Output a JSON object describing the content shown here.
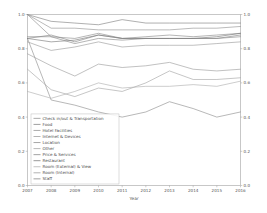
{
  "chart_data": {
    "type": "line",
    "title": "",
    "xlabel": "Year",
    "ylabel": "",
    "x": [
      2007,
      2008,
      2009,
      2010,
      2011,
      2012,
      2013,
      2014,
      2015,
      2016
    ],
    "xticklabels": [
      "2007",
      "2008",
      "2009",
      "2010",
      "2011",
      "2012",
      "2013",
      "2014",
      "2015",
      "2016"
    ],
    "yticklabels": [
      "0.0",
      "0.2",
      "0.4",
      "0.6",
      "0.8",
      "1.0"
    ],
    "yticks": [
      0.0,
      0.2,
      0.4,
      0.6,
      0.8,
      1.0
    ],
    "xlim": [
      2007,
      2016
    ],
    "ylim": [
      0.0,
      1.0
    ],
    "grid": false,
    "right_axis_mirrored": true,
    "right_yticklabels": [
      "0.0",
      "0.2",
      "0.4",
      "0.6",
      "0.8",
      "1.0"
    ],
    "legend_position": "lower left",
    "series": [
      {
        "name": "Check in/out & Transportation",
        "color": "#8c8c8c",
        "values": [
          0.86,
          0.5,
          0.47,
          0.43,
          0.4,
          0.43,
          0.49,
          0.45,
          0.4,
          0.43
        ]
      },
      {
        "name": "Food",
        "color": "#7f7f7f",
        "values": [
          1.0,
          0.96,
          0.95,
          0.94,
          0.97,
          0.95,
          0.95,
          0.95,
          0.95,
          0.95
        ]
      },
      {
        "name": "Hotel Facilities",
        "color": "#909090",
        "values": [
          1.0,
          0.92,
          0.92,
          0.91,
          0.91,
          0.91,
          0.91,
          0.92,
          0.92,
          0.93
        ]
      },
      {
        "name": "Internet & Devices",
        "color": "#9b9b9b",
        "values": [
          0.77,
          0.7,
          0.64,
          0.71,
          0.69,
          0.7,
          0.72,
          0.68,
          0.67,
          0.68
        ]
      },
      {
        "name": "Location",
        "color": "#888888",
        "values": [
          1.0,
          0.87,
          0.86,
          0.89,
          0.86,
          0.87,
          0.88,
          0.87,
          0.88,
          0.89
        ]
      },
      {
        "name": "Other",
        "color": "#a2a2a2",
        "values": [
          0.68,
          0.56,
          0.52,
          0.57,
          0.55,
          0.6,
          0.67,
          0.62,
          0.62,
          0.63
        ]
      },
      {
        "name": "Price & Services",
        "color": "#868686",
        "values": [
          0.87,
          0.87,
          0.83,
          0.86,
          0.85,
          0.86,
          0.86,
          0.86,
          0.86,
          0.87
        ]
      },
      {
        "name": "Restaurant",
        "color": "#777777",
        "values": [
          0.86,
          0.84,
          0.85,
          0.88,
          0.86,
          0.86,
          0.86,
          0.86,
          0.87,
          0.89
        ]
      },
      {
        "name": "Room (External) & View",
        "color": "#adadad",
        "values": [
          0.55,
          0.51,
          0.55,
          0.6,
          0.57,
          0.58,
          0.58,
          0.59,
          0.58,
          0.61
        ]
      },
      {
        "name": "Room (Internal)",
        "color": "#999999",
        "values": [
          0.84,
          0.79,
          0.81,
          0.84,
          0.81,
          0.82,
          0.82,
          0.82,
          0.83,
          0.84
        ]
      },
      {
        "name": "Staff",
        "color": "#828282",
        "values": [
          0.86,
          0.88,
          0.84,
          0.88,
          0.86,
          0.86,
          0.86,
          0.86,
          0.86,
          0.88
        ]
      }
    ]
  }
}
